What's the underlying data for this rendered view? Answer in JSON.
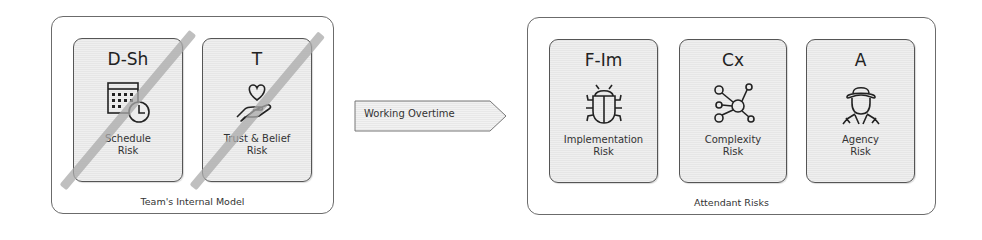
{
  "left_group": {
    "label": "Team's Internal Model",
    "cards": [
      {
        "code": "D-Sh",
        "label_line1": "Schedule",
        "label_line2": "Risk",
        "icon": "calendar-clock-icon",
        "struck_out": true
      },
      {
        "code": "T",
        "label_line1": "Trust & Belief",
        "label_line2": "Risk",
        "icon": "heart-in-hand-icon",
        "struck_out": true
      }
    ]
  },
  "transition": {
    "label": "Working Overtime",
    "icon": "arrow-right-shape"
  },
  "right_group": {
    "label": "Attendant Risks",
    "cards": [
      {
        "code": "F-Im",
        "label_line1": "Implementation",
        "label_line2": "Risk",
        "icon": "bug-icon",
        "struck_out": false
      },
      {
        "code": "Cx",
        "label_line1": "Complexity",
        "label_line2": "Risk",
        "icon": "network-nodes-icon",
        "struck_out": false
      },
      {
        "code": "A",
        "label_line1": "Agency",
        "label_line2": "Risk",
        "icon": "detective-person-icon",
        "struck_out": false
      }
    ]
  },
  "colors": {
    "border": "#555555",
    "card_fill": "#eaeaea",
    "strike": "#aaaaaa"
  }
}
